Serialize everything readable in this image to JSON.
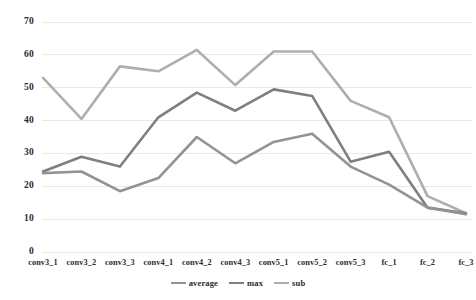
{
  "chart_data": {
    "type": "line",
    "title": "",
    "xlabel": "",
    "ylabel": "",
    "grid": true,
    "legend_position": "bottom-center",
    "ylim": [
      0,
      70
    ],
    "ytick_labels": [
      "70",
      "60",
      "50",
      "40",
      "30",
      "20",
      "10",
      "0"
    ],
    "ytick_values": [
      70,
      60,
      50,
      40,
      30,
      20,
      10,
      0
    ],
    "categories": [
      "conv3_1",
      "conv3_2",
      "conv3_3",
      "conv4_1",
      "conv4_2",
      "conv4_3",
      "conv5_1",
      "conv5_2",
      "conv5_3",
      "fc_1",
      "fc_2",
      "fc_3"
    ],
    "series": [
      {
        "name": "average",
        "color": "#939393",
        "values": [
          24,
          24.5,
          18.5,
          22.5,
          35,
          27,
          33.5,
          36,
          26,
          20.5,
          13.5,
          11.5
        ]
      },
      {
        "name": "max",
        "color": "#7f7f7f",
        "values": [
          24.5,
          29,
          26,
          41,
          48.5,
          43,
          49.5,
          47.5,
          27.5,
          30.5,
          13.5,
          11.8
        ]
      },
      {
        "name": "sub",
        "color": "#aeaeae",
        "values": [
          53,
          40.5,
          56.5,
          55,
          61.5,
          50.8,
          61,
          61,
          46,
          41,
          17,
          11.8
        ]
      }
    ]
  },
  "colors": {
    "gridline": "#e8e8e8",
    "text": "#2b2b2b",
    "background": "#ffffff"
  }
}
